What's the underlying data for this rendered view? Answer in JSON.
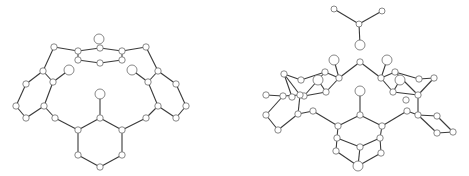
{
  "figure": {
    "colors": {
      "bond": "#3a3a3a",
      "atom_fill": "#ffffff",
      "atom_stroke": "#6a6a6a"
    }
  },
  "molecules": [
    {
      "name": "left-molecule",
      "atoms": [
        [
          99,
          39,
          5
        ],
        [
          78,
          51,
          3.2
        ],
        [
          100,
          48,
          3.2
        ],
        [
          122,
          51,
          3.2
        ],
        [
          78,
          60,
          3.2
        ],
        [
          100,
          63,
          3.2
        ],
        [
          122,
          60,
          3.2
        ],
        [
          54,
          47,
          3.2
        ],
        [
          146,
          47,
          3.2
        ],
        [
          43,
          71,
          3.2
        ],
        [
          53,
          82,
          3.2
        ],
        [
          26,
          84,
          3.2
        ],
        [
          16,
          106,
          3.2
        ],
        [
          26,
          118,
          3.2
        ],
        [
          44,
          106,
          3.2
        ],
        [
          55,
          118,
          3.2
        ],
        [
          69,
          70,
          5
        ],
        [
          158,
          71,
          3.2
        ],
        [
          148,
          82,
          3.2
        ],
        [
          176,
          84,
          3.2
        ],
        [
          186,
          106,
          3.2
        ],
        [
          176,
          118,
          3.2
        ],
        [
          158,
          106,
          3.2
        ],
        [
          146,
          118,
          3.2
        ],
        [
          132,
          70,
          5
        ],
        [
          100,
          94,
          5
        ],
        [
          100,
          118,
          3.2
        ],
        [
          78,
          130,
          3.2
        ],
        [
          122,
          130,
          3.2
        ],
        [
          78,
          155,
          3.2
        ],
        [
          122,
          155,
          3.2
        ],
        [
          100,
          167,
          3.2
        ]
      ],
      "bonds": [
        [
          1,
          2
        ],
        [
          2,
          3
        ],
        [
          1,
          4
        ],
        [
          4,
          5
        ],
        [
          5,
          6
        ],
        [
          3,
          6
        ],
        [
          1,
          7
        ],
        [
          3,
          8
        ],
        [
          7,
          9
        ],
        [
          9,
          10
        ],
        [
          9,
          11
        ],
        [
          11,
          12
        ],
        [
          12,
          13
        ],
        [
          13,
          14
        ],
        [
          14,
          10
        ],
        [
          10,
          16
        ],
        [
          14,
          15
        ],
        [
          8,
          17
        ],
        [
          17,
          18
        ],
        [
          17,
          19
        ],
        [
          19,
          20
        ],
        [
          20,
          21
        ],
        [
          21,
          22
        ],
        [
          22,
          18
        ],
        [
          18,
          24
        ],
        [
          22,
          23
        ],
        [
          15,
          27
        ],
        [
          23,
          28
        ],
        [
          25,
          26
        ],
        [
          26,
          27
        ],
        [
          26,
          28
        ],
        [
          27,
          29
        ],
        [
          28,
          30
        ],
        [
          29,
          31
        ],
        [
          30,
          31
        ]
      ]
    },
    {
      "name": "right-molecule",
      "atoms": [
        [
          334,
          9,
          3
        ],
        [
          382,
          11,
          3
        ],
        [
          359,
          24,
          3
        ],
        [
          360,
          45,
          5
        ],
        [
          360,
          62,
          3.2
        ],
        [
          334,
          60,
          5
        ],
        [
          387,
          60,
          5
        ],
        [
          339,
          78,
          3.2
        ],
        [
          325,
          72,
          3.2
        ],
        [
          318,
          80,
          5
        ],
        [
          326,
          92,
          3.2
        ],
        [
          304,
          96,
          3.2
        ],
        [
          301,
          80,
          3.2
        ],
        [
          284,
          74,
          3.2
        ],
        [
          300,
          95,
          3.2
        ],
        [
          283,
          96,
          3.2
        ],
        [
          266,
          115,
          3.2
        ],
        [
          278,
          130,
          3.2
        ],
        [
          298,
          114,
          3.2
        ],
        [
          292,
          97,
          3.2
        ],
        [
          266,
          95,
          3.2
        ],
        [
          381,
          78,
          3.2
        ],
        [
          395,
          72,
          3.2
        ],
        [
          400,
          80,
          5
        ],
        [
          393,
          92,
          3.2
        ],
        [
          418,
          95,
          3.2
        ],
        [
          419,
          79,
          3.2
        ],
        [
          434,
          78,
          3.2
        ],
        [
          418,
          115,
          3.2
        ],
        [
          437,
          116,
          3.2
        ],
        [
          453,
          132,
          3.2
        ],
        [
          437,
          133,
          3.2
        ],
        [
          406,
          100,
          3.2
        ],
        [
          313,
          111,
          3.2
        ],
        [
          407,
          111,
          3.2
        ],
        [
          360,
          91,
          5
        ],
        [
          360,
          115,
          3.2
        ],
        [
          338,
          126,
          3.2
        ],
        [
          382,
          126,
          3.2
        ],
        [
          337,
          138,
          3.2
        ],
        [
          336,
          151,
          3.2
        ],
        [
          360,
          147,
          3.2
        ],
        [
          380,
          138,
          3.2
        ],
        [
          381,
          153,
          3.2
        ],
        [
          358,
          166,
          5
        ]
      ],
      "bonds": [
        [
          0,
          2
        ],
        [
          1,
          2
        ],
        [
          2,
          3
        ],
        [
          4,
          7
        ],
        [
          4,
          21
        ],
        [
          7,
          5
        ],
        [
          7,
          8
        ],
        [
          8,
          12
        ],
        [
          12,
          13
        ],
        [
          13,
          14
        ],
        [
          14,
          11
        ],
        [
          11,
          8
        ],
        [
          10,
          7
        ],
        [
          10,
          11
        ],
        [
          9,
          10
        ],
        [
          14,
          18
        ],
        [
          14,
          15
        ],
        [
          15,
          16
        ],
        [
          16,
          17
        ],
        [
          18,
          17
        ],
        [
          18,
          33
        ],
        [
          19,
          13
        ],
        [
          20,
          15
        ],
        [
          21,
          6
        ],
        [
          21,
          22
        ],
        [
          22,
          26
        ],
        [
          26,
          27
        ],
        [
          27,
          25
        ],
        [
          25,
          22
        ],
        [
          24,
          21
        ],
        [
          24,
          25
        ],
        [
          23,
          24
        ],
        [
          25,
          28
        ],
        [
          28,
          29
        ],
        [
          29,
          30
        ],
        [
          30,
          31
        ],
        [
          31,
          28
        ],
        [
          28,
          34
        ],
        [
          33,
          37
        ],
        [
          34,
          38
        ],
        [
          35,
          36
        ],
        [
          36,
          37
        ],
        [
          36,
          38
        ],
        [
          37,
          39
        ],
        [
          39,
          40
        ],
        [
          40,
          44
        ],
        [
          41,
          39
        ],
        [
          41,
          42
        ],
        [
          38,
          42
        ],
        [
          42,
          43
        ],
        [
          43,
          44
        ],
        [
          41,
          44
        ]
      ]
    }
  ]
}
